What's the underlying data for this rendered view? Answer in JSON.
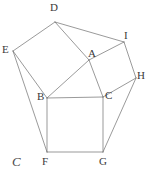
{
  "figure": {
    "canvas": {
      "width": 150,
      "height": 179
    },
    "style": {
      "stroke_color": "#6e6e6e",
      "stroke_width": 0.7,
      "background_color": "#ffffff",
      "label_color": "#3a3a3a",
      "corner_label_color": "#4a4a4a"
    },
    "points": {
      "A": {
        "x": 89,
        "y": 60,
        "label": "A",
        "label_x": 88,
        "label_y": 48
      },
      "B": {
        "x": 47,
        "y": 98,
        "label": "B",
        "label_x": 37,
        "label_y": 91
      },
      "C": {
        "x": 103,
        "y": 97,
        "label": "C",
        "label_x": 105,
        "label_y": 90
      },
      "D": {
        "x": 55,
        "y": 22,
        "label": "D",
        "label_x": 50,
        "label_y": 2
      },
      "E": {
        "x": 13,
        "y": 51,
        "label": "E",
        "label_x": 2,
        "label_y": 44
      },
      "F": {
        "x": 47,
        "y": 152,
        "label": "F",
        "label_x": 42,
        "label_y": 156
      },
      "G": {
        "x": 103,
        "y": 152,
        "label": "G",
        "label_x": 99,
        "label_y": 156
      },
      "H": {
        "x": 136,
        "y": 78,
        "label": "H",
        "label_x": 137,
        "label_y": 70
      },
      "I": {
        "x": 124,
        "y": 42,
        "label": "I",
        "label_x": 124,
        "label_y": 30
      }
    },
    "segments": [
      {
        "name": "triangle-side-AB",
        "from": "A",
        "to": "B"
      },
      {
        "name": "triangle-side-AC",
        "from": "A",
        "to": "C"
      },
      {
        "name": "triangle-side-BC",
        "from": "B",
        "to": "C"
      },
      {
        "name": "square-ab-side-AD",
        "from": "A",
        "to": "D"
      },
      {
        "name": "square-ab-side-DE",
        "from": "D",
        "to": "E"
      },
      {
        "name": "square-ab-side-EB",
        "from": "E",
        "to": "B"
      },
      {
        "name": "square-ac-side-AI",
        "from": "A",
        "to": "I"
      },
      {
        "name": "square-ac-side-IH",
        "from": "I",
        "to": "H"
      },
      {
        "name": "square-ac-side-HC",
        "from": "H",
        "to": "C"
      },
      {
        "name": "square-bc-side-BF",
        "from": "B",
        "to": "F"
      },
      {
        "name": "square-bc-side-FG",
        "from": "F",
        "to": "G"
      },
      {
        "name": "square-bc-side-GC",
        "from": "G",
        "to": "C"
      },
      {
        "name": "hull-edge-EF",
        "from": "E",
        "to": "F"
      },
      {
        "name": "hull-edge-HG",
        "from": "H",
        "to": "G"
      },
      {
        "name": "diagonal-DI",
        "from": "D",
        "to": "I"
      }
    ],
    "corner_marks": [
      {
        "name": "corner-label-c",
        "text": "C",
        "x": 12,
        "y": 155
      }
    ]
  }
}
